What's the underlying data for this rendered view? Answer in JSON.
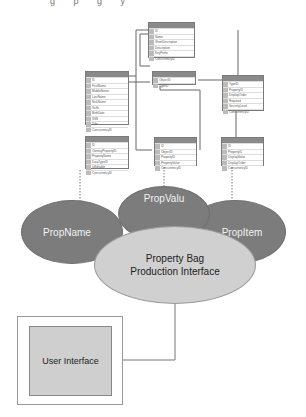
{
  "diagram": {
    "top_fragment": "g p g y",
    "tables": [
      {
        "id": "t_top",
        "fields": [
          "ID",
          "Name",
          "ShortDescription",
          "Description",
          "KeyPrefix",
          "ConcurrencyID"
        ]
      },
      {
        "id": "t_left",
        "fields": [
          "ID",
          "FirstName",
          "MiddleName",
          "LastName",
          "NickName",
          "Suffix",
          "BirthDate",
          "SSN",
          "Title",
          "ConcurrencyID"
        ]
      },
      {
        "id": "t_mid",
        "fields": [
          "ObjectID",
          "TypeID"
        ]
      },
      {
        "id": "t_right",
        "fields": [
          "TypeID",
          "PropertyID",
          "DisplayOrder",
          "Required",
          "SecurityLevel",
          "ConcurrencyID"
        ]
      },
      {
        "id": "t_propname",
        "fields": [
          "ID",
          "OwningPropertyID",
          "PropertyName",
          "DataTypeID",
          "IsEditable",
          "ConcurrencyID"
        ]
      },
      {
        "id": "t_propvalu",
        "fields": [
          "ID",
          "ObjectID",
          "PropertyID",
          "PropertyValue",
          "ConcurrencyID"
        ]
      },
      {
        "id": "t_propitem",
        "fields": [
          "ID",
          "PropertyID",
          "DisplayValue",
          "DisplayOrder",
          "ConcurrencyID"
        ]
      }
    ],
    "ellipses": {
      "propname": "PropName",
      "propvalu": "PropValu",
      "propitem": "PropItem",
      "interface_line1": "Property Bag",
      "interface_line2": "Production Interface"
    },
    "user_interface": "User Interface",
    "colors": {
      "dark_ellipse": "#7c7c7c",
      "light_ellipse": "#d0d0d0",
      "ui_box": "#cfcfcf"
    }
  }
}
